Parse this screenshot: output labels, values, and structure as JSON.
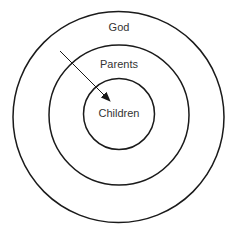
{
  "diagram": {
    "type": "concentric-circles",
    "circles": [
      {
        "name": "outer",
        "label": "God"
      },
      {
        "name": "middle",
        "label": "Parents"
      },
      {
        "name": "inner",
        "label": "Children"
      }
    ],
    "arrow": {
      "from": "God",
      "to": "Children"
    },
    "colors": {
      "stroke": "#1a1a1a",
      "text": "#333333",
      "background": "#ffffff"
    }
  }
}
